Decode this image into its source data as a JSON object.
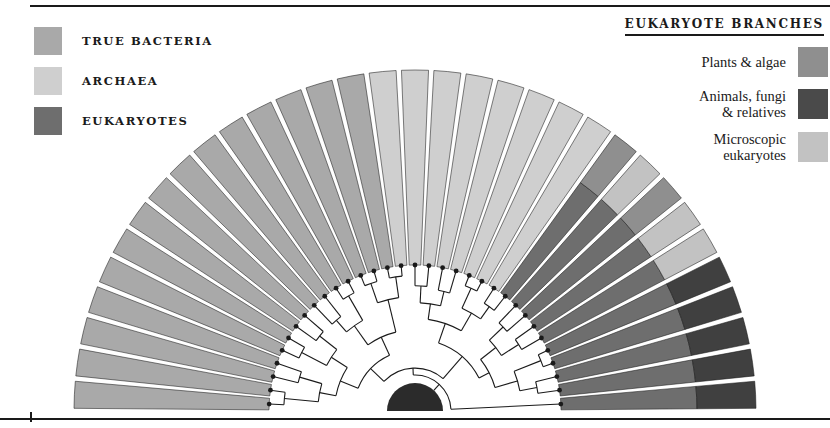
{
  "figure": {
    "type": "radial-phylogenetic-fan",
    "title_right": "EUKARYOTE BRANCHES"
  },
  "legend_left": {
    "items": [
      {
        "label": "TRUE BACTERIA",
        "color": "#a9a9a9",
        "name": "true-bacteria"
      },
      {
        "label": "ARCHAEA",
        "color": "#cfcfcf",
        "name": "archaea"
      },
      {
        "label": "EUKARYOTES",
        "color": "#6e6e6e",
        "name": "eukaryotes"
      }
    ]
  },
  "legend_right": {
    "title": "EUKARYOTE BRANCHES",
    "items": [
      {
        "label": "Plants & algae",
        "color": "#8f8f8f",
        "name": "plants-and-algae"
      },
      {
        "label": "Animals, fungi\n& relatives",
        "color": "#4a4a4a",
        "name": "animals-fungi-relatives"
      },
      {
        "label": "Microscopic\neukaryotes",
        "color": "#c2c2c2",
        "name": "microscopic-eukaryotes"
      }
    ]
  },
  "colors": {
    "true_bacteria": "#a9a9a9",
    "archaea": "#cfcfcf",
    "eukaryotes": "#6e6e6e",
    "plants_algae": "#8f8f8f",
    "animals_fungi": "#404040",
    "microscopic_euk": "#c2c2c2",
    "root": "#2b2b2b",
    "stroke": "#1a1a1a",
    "background": "#ffffff"
  },
  "chart_data": {
    "type": "pie",
    "title": "",
    "geometry": {
      "cx": 415,
      "cy": 411,
      "r_outer": 341,
      "r_band": 282,
      "r_tips": 146,
      "r_root": 28,
      "angle_start_deg": 180,
      "angle_end_deg": 360,
      "gap_deg": 0.9
    },
    "domains": [
      {
        "name": "TRUE BACTERIA",
        "group": "true_bacteria",
        "sectors": 15
      },
      {
        "name": "ARCHAEA",
        "group": "archaea",
        "sectors": 8
      },
      {
        "name": "EUKARYOTES",
        "group": "eukaryotes",
        "sectors": 10
      }
    ],
    "eukaryote_band": [
      {
        "branch": "Plants & algae",
        "group": "plants_algae",
        "sectors": 1
      },
      {
        "branch": "Microscopic eukaryotes",
        "group": "microscopic_euk",
        "sectors": 1
      },
      {
        "branch": "Plants & algae",
        "group": "plants_algae",
        "sectors": 1
      },
      {
        "branch": "Microscopic eukaryotes",
        "group": "microscopic_euk",
        "sectors": 2
      },
      {
        "branch": "Animals, fungi & relatives",
        "group": "animals_fungi",
        "sectors": 5
      }
    ],
    "tree": {
      "description": "Nested rectangular cladogram rendered in the white annulus between the root semicircle and the coloured wedge tips; black dots mark the 33 terminal tips.",
      "tip_count": 33,
      "internal_node_radii": [
        46,
        60,
        74,
        88,
        102,
        116,
        130
      ]
    }
  }
}
